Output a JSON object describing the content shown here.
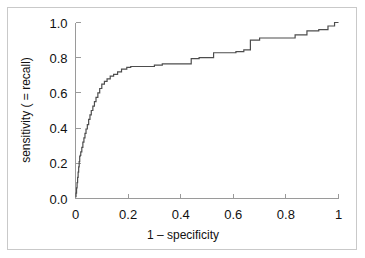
{
  "figure": {
    "name": "roc-curve-figure",
    "background_color": "#ffffff",
    "frame_color": "#c9c9c9",
    "curve_color": "#4d4d4d",
    "axis_color": "#9a9a9a"
  },
  "chart_data": {
    "type": "line",
    "title": "",
    "subtitle": "",
    "xlabel": "1 – specificity",
    "ylabel": "sensitivity ( = recall)",
    "xlim": [
      0,
      1
    ],
    "ylim": [
      0,
      1
    ],
    "grid": false,
    "legend": null,
    "legend_position": "none",
    "x_tick_labels": [
      "0",
      "0.2",
      "0.4",
      "0.6",
      "0.8",
      "1"
    ],
    "x_tick_values": [
      0,
      0.2,
      0.4,
      0.6,
      0.8,
      1
    ],
    "y_tick_labels": [
      "0.0",
      "0.2",
      "0.4",
      "0.6",
      "0.8",
      "1.0"
    ],
    "y_tick_values": [
      0,
      0.2,
      0.4,
      0.6,
      0.8,
      1
    ],
    "series": [
      {
        "name": "ROC",
        "drawstyle": "steps-post",
        "x": [
          0.0,
          0.002,
          0.002,
          0.004,
          0.004,
          0.006,
          0.006,
          0.008,
          0.008,
          0.01,
          0.01,
          0.012,
          0.012,
          0.014,
          0.014,
          0.016,
          0.016,
          0.018,
          0.018,
          0.02,
          0.02,
          0.024,
          0.024,
          0.028,
          0.028,
          0.032,
          0.032,
          0.036,
          0.036,
          0.04,
          0.04,
          0.045,
          0.045,
          0.05,
          0.05,
          0.055,
          0.055,
          0.06,
          0.06,
          0.066,
          0.066,
          0.072,
          0.072,
          0.078,
          0.078,
          0.085,
          0.085,
          0.092,
          0.092,
          0.1,
          0.1,
          0.11,
          0.11,
          0.12,
          0.12,
          0.132,
          0.132,
          0.145,
          0.145,
          0.16,
          0.16,
          0.175,
          0.175,
          0.195,
          0.195,
          0.21,
          0.21,
          0.3,
          0.3,
          0.33,
          0.33,
          0.44,
          0.44,
          0.47,
          0.47,
          0.525,
          0.525,
          0.61,
          0.61,
          0.64,
          0.64,
          0.665,
          0.665,
          0.7,
          0.7,
          0.835,
          0.835,
          0.88,
          0.88,
          0.925,
          0.925,
          0.96,
          0.96,
          0.985,
          0.985,
          1.0
        ],
        "y": [
          0.01,
          0.01,
          0.03,
          0.03,
          0.06,
          0.06,
          0.09,
          0.09,
          0.12,
          0.12,
          0.15,
          0.15,
          0.18,
          0.18,
          0.21,
          0.21,
          0.24,
          0.24,
          0.245,
          0.245,
          0.265,
          0.265,
          0.29,
          0.29,
          0.32,
          0.32,
          0.345,
          0.345,
          0.37,
          0.37,
          0.395,
          0.395,
          0.42,
          0.42,
          0.45,
          0.45,
          0.475,
          0.475,
          0.5,
          0.5,
          0.525,
          0.525,
          0.55,
          0.55,
          0.575,
          0.575,
          0.6,
          0.6,
          0.625,
          0.625,
          0.65,
          0.65,
          0.665,
          0.665,
          0.68,
          0.68,
          0.695,
          0.695,
          0.705,
          0.705,
          0.72,
          0.72,
          0.735,
          0.735,
          0.745,
          0.745,
          0.75,
          0.75,
          0.758,
          0.758,
          0.765,
          0.765,
          0.795,
          0.795,
          0.8,
          0.8,
          0.828,
          0.828,
          0.835,
          0.835,
          0.845,
          0.845,
          0.9,
          0.9,
          0.912,
          0.912,
          0.93,
          0.93,
          0.952,
          0.952,
          0.96,
          0.96,
          0.98,
          0.98,
          1.0,
          1.0
        ]
      }
    ]
  }
}
